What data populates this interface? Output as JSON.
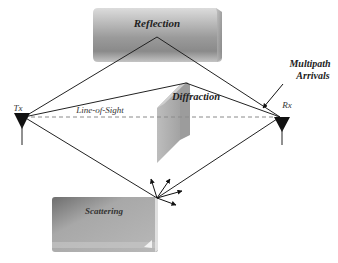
{
  "diagram": {
    "labels": {
      "reflection": "Reflection",
      "diffraction": "Diffraction",
      "scattering": "Scattering",
      "line_of_sight": "Line-of-Sight",
      "tx": "Tx",
      "rx": "Rx",
      "multipath_line1": "Multipath",
      "multipath_line2": "Arrivals"
    },
    "nodes": [
      {
        "id": "tx",
        "label": "Tx",
        "type": "antenna",
        "x": 22,
        "y": 117
      },
      {
        "id": "rx",
        "label": "Rx",
        "type": "antenna",
        "x": 282,
        "y": 117
      },
      {
        "id": "reflection",
        "label": "Reflection",
        "type": "obstacle-block",
        "x": 93,
        "y": 8,
        "w": 129,
        "h": 54
      },
      {
        "id": "diffraction",
        "label": "Diffraction",
        "type": "obstacle-slab",
        "edge_x": 185,
        "edge_y": 83
      },
      {
        "id": "scattering",
        "label": "Scattering",
        "type": "obstacle-block",
        "x": 52,
        "y": 197,
        "w": 106,
        "h": 55
      }
    ],
    "paths": [
      {
        "from": "tx",
        "to": "rx",
        "via": "direct",
        "style": "dashed",
        "label": "Line-of-Sight"
      },
      {
        "from": "tx",
        "to": "rx",
        "via": "reflection",
        "style": "solid"
      },
      {
        "from": "tx",
        "to": "rx",
        "via": "diffraction",
        "style": "solid"
      },
      {
        "from": "tx",
        "to": "rx",
        "via": "scattering",
        "style": "solid"
      }
    ],
    "annotation": {
      "text": "Multipath Arrivals",
      "points_to": "rx"
    },
    "colors": {
      "line": "#222222",
      "dash": "#888888",
      "block_light": "#d2d2d2",
      "block_dark": "#7a7a7a",
      "antenna": "#111111"
    }
  }
}
